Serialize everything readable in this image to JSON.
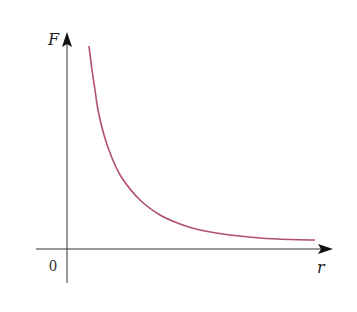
{
  "chart_data": {
    "type": "line",
    "title": "",
    "xlabel": "r",
    "ylabel": "F",
    "origin_label": "0",
    "grid": false,
    "legend": null,
    "series": [
      {
        "name": "F(r)",
        "color": "#b0506a",
        "points_px": [
          [
            89,
            46
          ],
          [
            92,
            70
          ],
          [
            95,
            90
          ],
          [
            98,
            110
          ],
          [
            104,
            135
          ],
          [
            112,
            158
          ],
          [
            122,
            178
          ],
          [
            140,
            200
          ],
          [
            160,
            215
          ],
          [
            180,
            224
          ],
          [
            200,
            230
          ],
          [
            230,
            235
          ],
          [
            260,
            238
          ],
          [
            290,
            239.5
          ],
          [
            315,
            240
          ]
        ]
      }
    ],
    "axes": {
      "origin_px": [
        67,
        249
      ],
      "x_end_px": 333,
      "y_end_px": 32,
      "axis_color": "#333333"
    }
  }
}
